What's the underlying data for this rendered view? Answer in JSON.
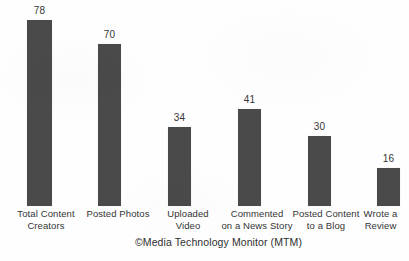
{
  "chart_data": {
    "type": "bar",
    "title": "",
    "subtitle": "",
    "xlabel": "",
    "ylabel": "",
    "grid": false,
    "legend": false,
    "legend_position": "none",
    "orientation": "vertical",
    "ylim": [
      0,
      86
    ],
    "categories": [
      "Total Content Creators",
      "Posted Photos",
      "Uploaded Video",
      "Commented on a News Story",
      "Posted Content to a Blog",
      "Wrote a Review"
    ],
    "values": [
      78,
      70,
      34,
      41,
      30,
      16
    ],
    "data_labels": [
      "78",
      "70",
      "34",
      "41",
      "30",
      "16"
    ],
    "annotations": [
      "©Media Technology Monitor (MTM)"
    ]
  },
  "bars": [
    {
      "value_label": "78",
      "label_lines": [
        "Total Content",
        "Creators"
      ],
      "left": 27,
      "width": 25,
      "height": 186,
      "value_top": 5
    },
    {
      "value_label": "70",
      "label_lines": [
        "Posted Photos",
        ""
      ],
      "left": 98,
      "width": 23,
      "height": 162,
      "value_top": 29
    },
    {
      "value_label": "34",
      "label_lines": [
        "Uploaded",
        "Video"
      ],
      "left": 168,
      "width": 23,
      "height": 79,
      "value_top": 112
    },
    {
      "value_label": "41",
      "label_lines": [
        "Commented",
        "on a News Story"
      ],
      "left": 238,
      "width": 23,
      "height": 97,
      "value_top": 94
    },
    {
      "value_label": "30",
      "label_lines": [
        "Posted Content",
        "to a Blog"
      ],
      "left": 308,
      "width": 23,
      "height": 70,
      "value_top": 121
    },
    {
      "value_label": "16",
      "label_lines": [
        "Wrote a",
        "Review"
      ],
      "left": 377,
      "width": 23,
      "height": 38,
      "value_top": 153
    }
  ],
  "labels": [
    {
      "left": 0,
      "width": 92,
      "line1": "Total Content",
      "line2": "Creators"
    },
    {
      "left": 72,
      "width": 92,
      "line1": "Posted Photos",
      "line2": ""
    },
    {
      "left": 144,
      "width": 88,
      "line1": "Uploaded",
      "line2": "Video"
    },
    {
      "left": 208,
      "width": 98,
      "line1": "Commented",
      "line2": "on a News Story"
    },
    {
      "left": 280,
      "width": 92,
      "line1": "Posted Content",
      "line2": "to a Blog"
    },
    {
      "left": 352,
      "width": 57,
      "line1": "Wrote a",
      "line2": "Review"
    }
  ],
  "attribution": {
    "text": "©Media Technology Monitor (MTM)"
  },
  "colors": {
    "bar_fill": "#4a4a4a",
    "background": "#fefefe",
    "text": "#343434"
  }
}
